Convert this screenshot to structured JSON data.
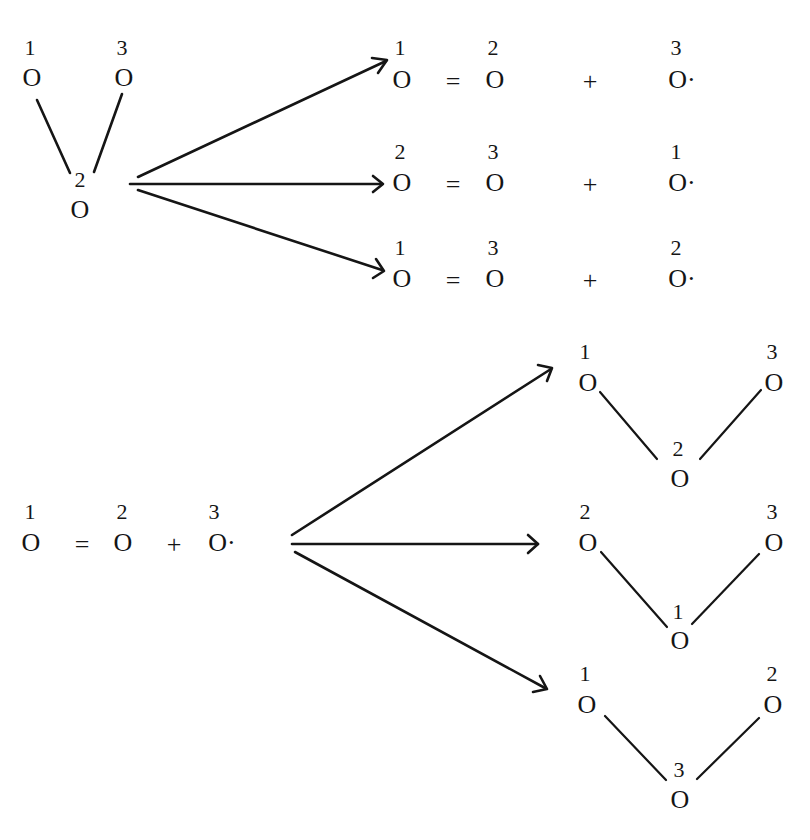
{
  "diagram": {
    "ink_color": "#151515",
    "background": "#ffffff",
    "atom_symbol": "O",
    "radical_symbol": "O·",
    "equals": "=",
    "plus": "+",
    "top": {
      "description": "Ozone molecule (atoms 1-2-3, central atom 2) dissociating into O2 + O· in three ways",
      "molecule": {
        "left": {
          "label": "1"
        },
        "right": {
          "label": "3"
        },
        "center": {
          "label": "2"
        }
      },
      "products": [
        {
          "a": "1",
          "b": "2",
          "radical": "3"
        },
        {
          "a": "2",
          "b": "3",
          "radical": "1"
        },
        {
          "a": "1",
          "b": "3",
          "radical": "2"
        }
      ]
    },
    "bottom": {
      "description": "O2 + O· recombining into three possible ozone arrangements",
      "reactants": {
        "a": "1",
        "b": "2",
        "radical": "3"
      },
      "molecules": [
        {
          "left": "1",
          "right": "3",
          "center": "2"
        },
        {
          "left": "2",
          "right": "3",
          "center": "1"
        },
        {
          "left": "1",
          "right": "2",
          "center": "3"
        }
      ]
    }
  }
}
